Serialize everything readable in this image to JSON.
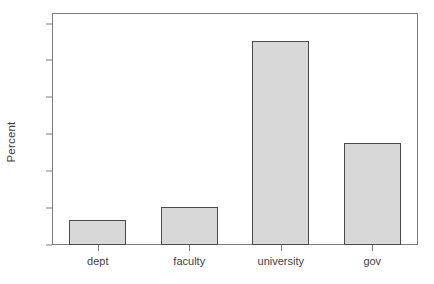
{
  "chart_data": {
    "type": "bar",
    "title": "",
    "xlabel": "",
    "ylabel": "Percent",
    "categories": [
      "dept",
      "faculty",
      "university",
      "gov"
    ],
    "values": [
      6.9,
      10.4,
      55.3,
      27.8
    ],
    "ylim": [
      0,
      63
    ],
    "yticks": [
      0,
      10,
      20,
      30,
      40,
      50,
      60
    ],
    "ytick_labels": [
      "0",
      "10",
      "20",
      "30",
      "40",
      "50",
      "60"
    ],
    "grid": false,
    "legend": null,
    "colors": {
      "bar_fill": "#d8d8d8",
      "bar_border": "#4a4a4a",
      "axis": "#7c7c7c",
      "text": "#3f3f3f",
      "background": "#ffffff"
    }
  }
}
